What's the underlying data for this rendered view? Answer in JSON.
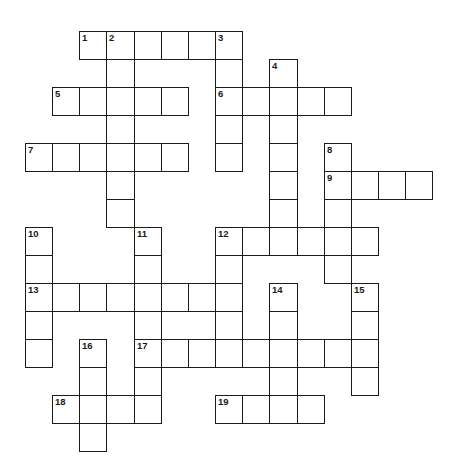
{
  "puzzle": {
    "layout": {
      "origin_x": 25,
      "origin_y": 30.5,
      "cell_w": 27.15,
      "cell_h": 28.0,
      "border_color": "#1a1a1a",
      "background": "#ffffff"
    },
    "entries": [
      {
        "number": 1,
        "direction": "across",
        "col": 2,
        "row": 0,
        "length": 6
      },
      {
        "number": 2,
        "direction": "down",
        "col": 3,
        "row": 0,
        "length": 7
      },
      {
        "number": 3,
        "direction": "down",
        "col": 7,
        "row": 0,
        "length": 5
      },
      {
        "number": 4,
        "direction": "down",
        "col": 9,
        "row": 1,
        "length": 7
      },
      {
        "number": 5,
        "direction": "across",
        "col": 1,
        "row": 2,
        "length": 5
      },
      {
        "number": 6,
        "direction": "across",
        "col": 7,
        "row": 2,
        "length": 5
      },
      {
        "number": 7,
        "direction": "across",
        "col": 0,
        "row": 4,
        "length": 6
      },
      {
        "number": 8,
        "direction": "down",
        "col": 11,
        "row": 4,
        "length": 5
      },
      {
        "number": 9,
        "direction": "across",
        "col": 11,
        "row": 5,
        "length": 4
      },
      {
        "number": 10,
        "direction": "down",
        "col": 0,
        "row": 7,
        "length": 5
      },
      {
        "number": 11,
        "direction": "down",
        "col": 4,
        "row": 7,
        "length": 7
      },
      {
        "number": 12,
        "direction": "across",
        "col": 7,
        "row": 7,
        "length": 6
      },
      {
        "number": 12,
        "direction": "down",
        "col": 7,
        "row": 7,
        "length": 5
      },
      {
        "number": 13,
        "direction": "across",
        "col": 0,
        "row": 9,
        "length": 8
      },
      {
        "number": 14,
        "direction": "down",
        "col": 9,
        "row": 9,
        "length": 5
      },
      {
        "number": 15,
        "direction": "down",
        "col": 12,
        "row": 9,
        "length": 4
      },
      {
        "number": 16,
        "direction": "down",
        "col": 2,
        "row": 11,
        "length": 4
      },
      {
        "number": 17,
        "direction": "across",
        "col": 4,
        "row": 11,
        "length": 9
      },
      {
        "number": 18,
        "direction": "across",
        "col": 1,
        "row": 13,
        "length": 4
      },
      {
        "number": 19,
        "direction": "across",
        "col": 7,
        "row": 13,
        "length": 4
      }
    ],
    "numbers": [
      {
        "label": "1",
        "col": 2,
        "row": 0
      },
      {
        "label": "2",
        "col": 3,
        "row": 0
      },
      {
        "label": "3",
        "col": 7,
        "row": 0
      },
      {
        "label": "4",
        "col": 9,
        "row": 1
      },
      {
        "label": "5",
        "col": 1,
        "row": 2
      },
      {
        "label": "6",
        "col": 7,
        "row": 2
      },
      {
        "label": "7",
        "col": 0,
        "row": 4
      },
      {
        "label": "8",
        "col": 11,
        "row": 4
      },
      {
        "label": "9",
        "col": 11,
        "row": 5
      },
      {
        "label": "10",
        "col": 0,
        "row": 7
      },
      {
        "label": "11",
        "col": 4,
        "row": 7
      },
      {
        "label": "12",
        "col": 7,
        "row": 7
      },
      {
        "label": "13",
        "col": 0,
        "row": 9
      },
      {
        "label": "14",
        "col": 9,
        "row": 9
      },
      {
        "label": "15",
        "col": 12,
        "row": 9
      },
      {
        "label": "16",
        "col": 2,
        "row": 11
      },
      {
        "label": "17",
        "col": 4,
        "row": 11
      },
      {
        "label": "18",
        "col": 1,
        "row": 13
      },
      {
        "label": "19",
        "col": 7,
        "row": 13
      }
    ],
    "filled_letters": []
  }
}
